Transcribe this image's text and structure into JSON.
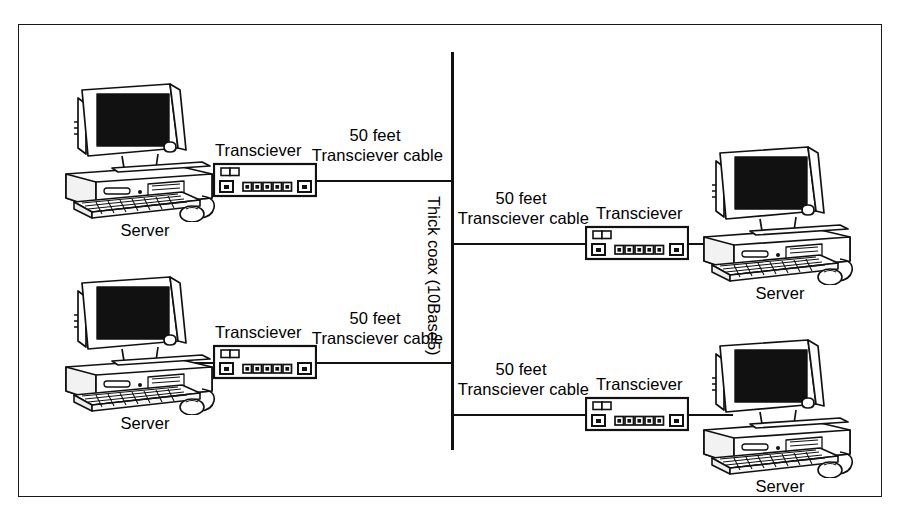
{
  "diagram": {
    "type": "network-topology",
    "backbone": {
      "label": "Thick coax (10Base5)",
      "orientation": "vertical",
      "color": "#111111"
    },
    "node_label": "Server",
    "device_label": "Transciever",
    "cable_length_label": "50 feet",
    "cable_label": "Transciever cable",
    "branches": [
      {
        "id": "branch-top-left",
        "side": "left",
        "server_label": "Server",
        "transceiver_label": "Transciever",
        "cable_line1": "50 feet",
        "cable_line2": "Transciever cable"
      },
      {
        "id": "branch-bottom-left",
        "side": "left",
        "server_label": "Server",
        "transceiver_label": "Transciever",
        "cable_line1": "50 feet",
        "cable_line2": "Transciever cable"
      },
      {
        "id": "branch-top-right",
        "side": "right",
        "server_label": "Server",
        "transceiver_label": "Transciever",
        "cable_line1": "50 feet",
        "cable_line2": "Transciever cable"
      },
      {
        "id": "branch-bottom-right",
        "side": "right",
        "server_label": "Server",
        "transceiver_label": "Transciever",
        "cable_line1": "50 feet",
        "cable_line2": "Transciever cable"
      }
    ],
    "colors": {
      "ink": "#111111",
      "screen": "#111111",
      "paper": "#ffffff",
      "shade": "#d9d9d9"
    }
  }
}
